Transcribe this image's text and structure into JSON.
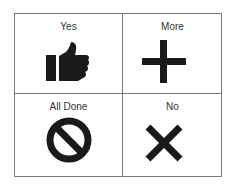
{
  "board": {
    "cells": [
      {
        "label": "Yes",
        "icon": "thumbs-up-icon"
      },
      {
        "label": "More",
        "icon": "plus-icon"
      },
      {
        "label": "All Done",
        "icon": "prohibited-icon"
      },
      {
        "label": "No",
        "icon": "x-icon"
      }
    ]
  },
  "colors": {
    "icon": "#1a1a1a",
    "border": "#7a7a7a",
    "text": "#333333"
  }
}
